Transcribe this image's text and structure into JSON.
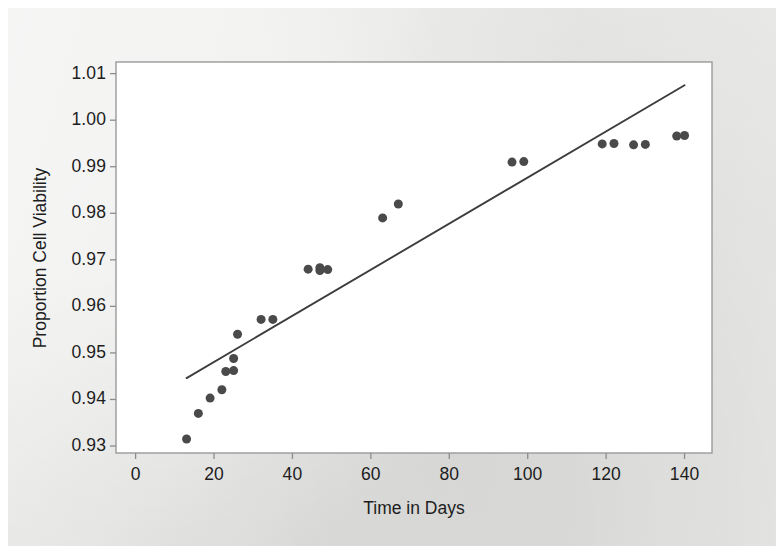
{
  "chart_data": {
    "type": "scatter",
    "title": "",
    "xlabel": "Time in Days",
    "ylabel": "Proportion Cell Viability",
    "xlim": [
      -5,
      147
    ],
    "ylim": [
      0.9285,
      1.0125
    ],
    "xticks": [
      0,
      20,
      40,
      60,
      80,
      100,
      120,
      140
    ],
    "xtick_labels": [
      "0",
      "20",
      "40",
      "60",
      "80",
      "100",
      "120",
      "140"
    ],
    "yticks": [
      0.93,
      0.94,
      0.95,
      0.96,
      0.97,
      0.98,
      0.99,
      1.0,
      1.01
    ],
    "ytick_labels": [
      "0.93",
      "0.94",
      "0.95",
      "0.96",
      "0.97",
      "0.98",
      "0.99",
      "1.00",
      "1.01"
    ],
    "grid": false,
    "legend": false,
    "marker_color": "#4a4a4a",
    "marker_size": 9,
    "line_color": "#3d3d3d",
    "axis_color": "#8c8c8c",
    "plot_background": "#ffffff",
    "figure_background": "#e8e8e6",
    "x": [
      13,
      16,
      19,
      22,
      23,
      25,
      25,
      26,
      28,
      32,
      35,
      44,
      47,
      47,
      49,
      63,
      67,
      96,
      99,
      119,
      122,
      127,
      130,
      138,
      140
    ],
    "y": [
      0.9315,
      0.937,
      0.9403,
      0.9421,
      0.946,
      0.9462,
      0.9488,
      0.954,
      0.9572,
      0.9572,
      0.968,
      0.9683,
      0.9677,
      0.9679,
      0.979,
      0.982,
      0.991,
      0.9911,
      0.9949,
      0.995,
      0.9947,
      0.9948,
      0.9966,
      0.9967,
      0.9965
    ],
    "points": [
      {
        "x": 13,
        "y": 0.9315
      },
      {
        "x": 16,
        "y": 0.937
      },
      {
        "x": 19,
        "y": 0.9403
      },
      {
        "x": 22,
        "y": 0.9421
      },
      {
        "x": 23,
        "y": 0.946
      },
      {
        "x": 25,
        "y": 0.9462
      },
      {
        "x": 25,
        "y": 0.9488
      },
      {
        "x": 26,
        "y": 0.954
      },
      {
        "x": 32,
        "y": 0.9572
      },
      {
        "x": 35,
        "y": 0.9572
      },
      {
        "x": 44,
        "y": 0.968
      },
      {
        "x": 47,
        "y": 0.9683
      },
      {
        "x": 47,
        "y": 0.9677
      },
      {
        "x": 49,
        "y": 0.9679
      },
      {
        "x": 63,
        "y": 0.979
      },
      {
        "x": 67,
        "y": 0.982
      },
      {
        "x": 96,
        "y": 0.991
      },
      {
        "x": 99,
        "y": 0.9911
      },
      {
        "x": 119,
        "y": 0.9949
      },
      {
        "x": 122,
        "y": 0.995
      },
      {
        "x": 127,
        "y": 0.9947
      },
      {
        "x": 130,
        "y": 0.9948
      },
      {
        "x": 138,
        "y": 0.9966
      },
      {
        "x": 140,
        "y": 0.9967
      }
    ],
    "fit_line": {
      "name": "regression line",
      "x_start": 13,
      "y_start": 0.9446,
      "x_end": 140,
      "y_end": 1.0075
    }
  }
}
